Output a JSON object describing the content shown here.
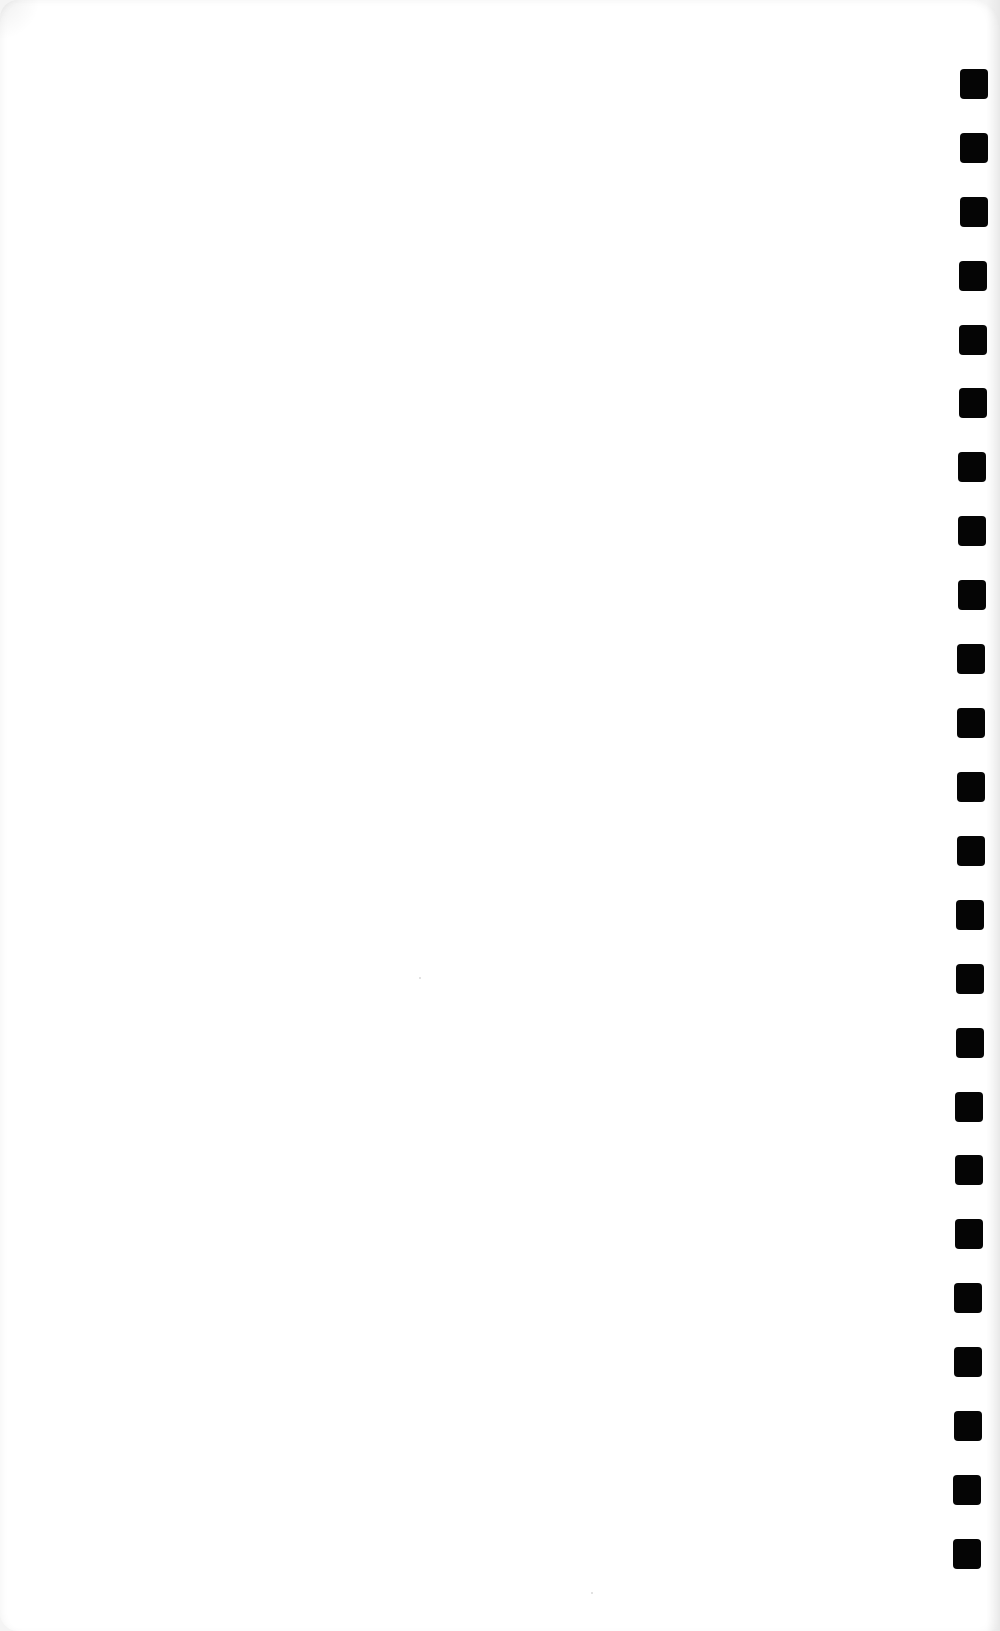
{
  "page": {
    "background": "#ffffff",
    "hole_color": "#050505",
    "hole_count": 24
  },
  "holes": [
    {
      "x": 960,
      "y": 69
    },
    {
      "x": 960,
      "y": 133
    },
    {
      "x": 960,
      "y": 197
    },
    {
      "x": 959,
      "y": 261
    },
    {
      "x": 959,
      "y": 325
    },
    {
      "x": 959,
      "y": 388
    },
    {
      "x": 958,
      "y": 452
    },
    {
      "x": 958,
      "y": 516
    },
    {
      "x": 958,
      "y": 580
    },
    {
      "x": 957,
      "y": 644
    },
    {
      "x": 957,
      "y": 708
    },
    {
      "x": 957,
      "y": 772
    },
    {
      "x": 957,
      "y": 836
    },
    {
      "x": 956,
      "y": 900
    },
    {
      "x": 956,
      "y": 964
    },
    {
      "x": 956,
      "y": 1028
    },
    {
      "x": 955,
      "y": 1092
    },
    {
      "x": 955,
      "y": 1155
    },
    {
      "x": 955,
      "y": 1219
    },
    {
      "x": 954,
      "y": 1283
    },
    {
      "x": 954,
      "y": 1347
    },
    {
      "x": 954,
      "y": 1411
    },
    {
      "x": 953,
      "y": 1475
    },
    {
      "x": 953,
      "y": 1539
    }
  ],
  "specks": [
    {
      "x": 419,
      "y": 977
    },
    {
      "x": 591,
      "y": 1592
    }
  ]
}
